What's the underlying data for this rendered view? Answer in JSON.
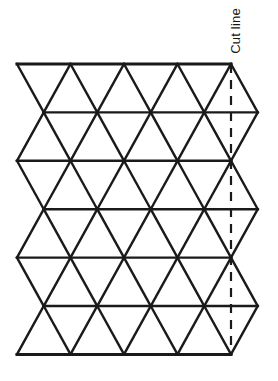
{
  "figure": {
    "annotations": {
      "cut_line_label": "Cut line"
    },
    "colors": {
      "stroke": "#1a1a1a",
      "background": "#ffffff",
      "cut_line": "#1a1a1a"
    },
    "geometry": {
      "origin_x": 17,
      "origin_y": 64,
      "column_step": 53.5,
      "row_step": 48.4,
      "columns": 5,
      "rows": 6,
      "half_step": 26.75
    },
    "cut_line": {
      "x": 231,
      "y_top": 64,
      "y_bottom": 355,
      "dash_pattern": "9,7",
      "stroke_width": 2.2
    },
    "stroke_width_grid": 2.4,
    "stroke_width_border": 3.0
  },
  "chart_data": {
    "type": "diagram",
    "elements": {
      "horizontal_lines_y": [
        64,
        112.4,
        160.8,
        209.2,
        257.6,
        306,
        354.4
      ],
      "even_row_vertices_x": [
        17,
        70.5,
        124,
        177.5,
        231
      ],
      "odd_row_vertices_x": [
        43.75,
        97.25,
        150.75,
        204.25,
        257.75
      ],
      "rows": 6,
      "columns": 5
    },
    "labels": [
      "Cut line"
    ]
  }
}
